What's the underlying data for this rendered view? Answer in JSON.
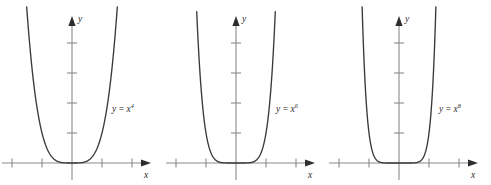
{
  "figure": {
    "background_color": "#ffffff",
    "curve_color": "#3a3a3a",
    "axis_color": "#8a8a8a",
    "text_color": "#2e2e2e"
  },
  "chart_data": [
    {
      "type": "line",
      "title": "",
      "function_label": "y = x",
      "exponent": "4",
      "expression": "y = x^4",
      "xlabel": "x",
      "ylabel": "y",
      "xlim": [
        -2.6,
        2.6
      ],
      "ylim": [
        -0.55,
        5.2
      ],
      "grid": false,
      "legend": "none",
      "x_ticks": [
        -2,
        -1,
        1,
        2
      ],
      "y_ticks": [
        1,
        2,
        3,
        4
      ],
      "x": [
        -1.45,
        -1.3,
        -1.15,
        -1.0,
        -0.85,
        -0.7,
        -0.55,
        -0.4,
        -0.25,
        0,
        0.25,
        0.4,
        0.55,
        0.7,
        0.85,
        1.0,
        1.15,
        1.3,
        1.45
      ],
      "values": [
        4.42,
        2.86,
        1.75,
        1.0,
        0.52,
        0.24,
        0.09,
        0.026,
        0.004,
        0,
        0.004,
        0.026,
        0.09,
        0.24,
        0.52,
        1.0,
        1.75,
        2.86,
        4.42
      ]
    },
    {
      "type": "line",
      "title": "",
      "function_label": "y = x",
      "exponent": "6",
      "expression": "y = x^6",
      "xlabel": "x",
      "ylabel": "y",
      "xlim": [
        -2.6,
        2.6
      ],
      "ylim": [
        -0.55,
        5.2
      ],
      "grid": false,
      "legend": "none",
      "x_ticks": [
        -2,
        -1,
        1,
        2
      ],
      "y_ticks": [
        1,
        2,
        3,
        4
      ],
      "x": [
        -1.28,
        -1.2,
        -1.1,
        -1.0,
        -0.9,
        -0.75,
        -0.6,
        -0.45,
        -0.3,
        0,
        0.3,
        0.45,
        0.6,
        0.75,
        0.9,
        1.0,
        1.1,
        1.2,
        1.28
      ],
      "values": [
        4.4,
        2.99,
        1.77,
        1.0,
        0.53,
        0.18,
        0.047,
        0.008,
        0.0007,
        0,
        0.0007,
        0.008,
        0.047,
        0.18,
        0.53,
        1.0,
        1.77,
        2.99,
        4.4
      ]
    },
    {
      "type": "line",
      "title": "",
      "function_label": "y = x",
      "exponent": "8",
      "expression": "y = x^8",
      "xlabel": "x",
      "ylabel": "y",
      "xlim": [
        -2.6,
        2.6
      ],
      "ylim": [
        -0.55,
        5.2
      ],
      "grid": false,
      "legend": "none",
      "x_ticks": [
        -2,
        -1,
        1,
        2
      ],
      "y_ticks": [
        1,
        2,
        3,
        4
      ],
      "x": [
        -1.2,
        -1.15,
        -1.08,
        -1.0,
        -0.92,
        -0.8,
        -0.65,
        -0.5,
        -0.35,
        0,
        0.35,
        0.5,
        0.65,
        0.8,
        0.92,
        1.0,
        1.08,
        1.15,
        1.2
      ],
      "values": [
        4.3,
        3.06,
        1.85,
        1.0,
        0.51,
        0.168,
        0.032,
        0.004,
        0.0002,
        0,
        0.0002,
        0.004,
        0.032,
        0.168,
        0.51,
        1.0,
        1.85,
        3.06,
        4.3
      ]
    }
  ]
}
